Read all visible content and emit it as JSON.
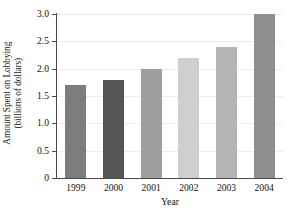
{
  "chart_data": {
    "type": "bar",
    "title": "",
    "subtitle": "",
    "xlabel": "Year",
    "ylabel": "Amount Spent on Lobbying (billions of dollars)",
    "ylabel_line1": "Amount Spent on Lobbying",
    "ylabel_line2": "(billions of dollars)",
    "categories": [
      "1999",
      "2000",
      "2001",
      "2002",
      "2003",
      "2004"
    ],
    "values": [
      1.7,
      1.8,
      2.0,
      2.2,
      2.4,
      3.0
    ],
    "bar_colors": [
      "#7d7d7d",
      "#555555",
      "#9e9e9e",
      "#cfcfcf",
      "#b5b5b5",
      "#8e8e8e"
    ],
    "ylim": [
      0,
      3.0
    ],
    "ytick_labels": [
      "0",
      "0.5",
      "1.0",
      "1.5",
      "2.0",
      "2.5",
      "3.0"
    ],
    "ytick_values": [
      0,
      0.5,
      1.0,
      1.5,
      2.0,
      2.5,
      3.0
    ],
    "grid": true,
    "grid_axis": "y",
    "grid_color": "#ededed",
    "legend": false,
    "legend_position": "none",
    "axis_color": "#4a4a4a",
    "background_color": "#ffffff",
    "text_color": "#141414"
  }
}
